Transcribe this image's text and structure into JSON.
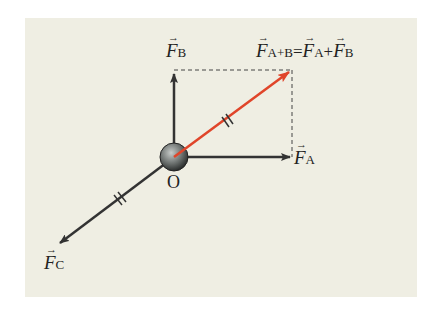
{
  "diagram": {
    "colors": {
      "background": "#efeee3",
      "vector": "#333333",
      "resultant": "#e0452a"
    },
    "origin_label": "O",
    "vectors": {
      "F_A": {
        "symbol": "F",
        "subscript": "A"
      },
      "F_B": {
        "symbol": "F",
        "subscript": "B"
      },
      "F_C": {
        "symbol": "F",
        "subscript": "C"
      }
    },
    "resultant_label": {
      "lhs_symbol": "F",
      "lhs_subscript": "A+B",
      "equals": "=",
      "t1_symbol": "F",
      "t1_subscript": "A",
      "plus": "+",
      "t2_symbol": "F",
      "t2_subscript": "B"
    },
    "arrow_glyph": "→"
  }
}
